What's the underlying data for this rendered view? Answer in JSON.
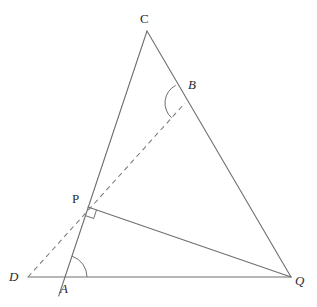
{
  "figure": {
    "kind": "euclidean-geometry-diagram",
    "width": 317,
    "height": 307,
    "background_color": "#ffffff",
    "stroke_color": "#6f6f6f",
    "label_color": "#2b2b2b"
  },
  "points": {
    "C": {
      "label": "C",
      "x": 147,
      "y": 31,
      "label_x": 140,
      "label_y": 12,
      "italic": false
    },
    "B": {
      "label": "B",
      "x": 185,
      "y": 103,
      "label_x": 188,
      "label_y": 78,
      "italic": true
    },
    "P": {
      "label": "P",
      "x": 88,
      "y": 207,
      "label_x": 72,
      "label_y": 192,
      "italic": false
    },
    "D": {
      "label": "D",
      "x": 28,
      "y": 277,
      "label_x": 9,
      "label_y": 270,
      "italic": true
    },
    "A": {
      "label": "A",
      "x": 65,
      "y": 277,
      "label_x": 60,
      "label_y": 282,
      "italic": true
    },
    "Q": {
      "label": "Q",
      "x": 291,
      "y": 277,
      "label_x": 295,
      "label_y": 274,
      "italic": true
    }
  },
  "segments": [
    {
      "name": "segment-CA",
      "from": "C",
      "to": "A",
      "style": "solid",
      "extends_to": {
        "x": 62,
        "y": 296
      }
    },
    {
      "name": "segment-CQ",
      "from": "C",
      "to": "Q",
      "style": "solid"
    },
    {
      "name": "segment-DQ",
      "from": "D",
      "to": "Q",
      "style": "solid"
    },
    {
      "name": "segment-PQ",
      "from": "P",
      "to": "Q",
      "style": "solid"
    },
    {
      "name": "segment-DB",
      "from": "D",
      "to": "B",
      "style": "dashed"
    }
  ],
  "markings": [
    {
      "name": "angle-arc-at-A",
      "vertex": "A",
      "type": "arc",
      "radius": 22
    },
    {
      "name": "angle-arc-at-B",
      "vertex": "B",
      "type": "arc",
      "radius": 20
    },
    {
      "name": "right-angle-at-P",
      "vertex": "P",
      "type": "square",
      "size": 9
    }
  ],
  "labels": {
    "C": "C",
    "B": "B",
    "P": "P",
    "D": "D",
    "A": "A",
    "Q": "Q"
  }
}
